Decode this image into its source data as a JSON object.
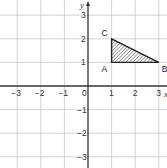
{
  "chart_data": {
    "type": "scatter",
    "title": "",
    "xlabel": "x",
    "ylabel": "y",
    "xlim": [
      -3.3,
      3.3
    ],
    "ylim": [
      -3.3,
      3.3
    ],
    "grid": true,
    "x_ticks": [
      -3,
      -2,
      -1,
      0,
      1,
      2,
      3
    ],
    "y_ticks": [
      -3,
      -2,
      -1,
      1,
      2,
      3
    ],
    "x_tick_labels": [
      "−3",
      "−2",
      "−1",
      "0",
      "1",
      "2",
      "3"
    ],
    "y_tick_labels": [
      "−3",
      "−2",
      "−1",
      "1",
      "2",
      "3"
    ],
    "shapes": [
      {
        "type": "triangle",
        "fill": "hatched",
        "vertices": [
          {
            "label": "A",
            "x": 1,
            "y": 1
          },
          {
            "label": "B",
            "x": 3,
            "y": 1
          },
          {
            "label": "C",
            "x": 1,
            "y": 2
          }
        ]
      }
    ]
  },
  "colors": {
    "grid": "#c8c8c8",
    "axis": "#333333",
    "triangle_edge": "#222222",
    "hatch": "#555555"
  }
}
